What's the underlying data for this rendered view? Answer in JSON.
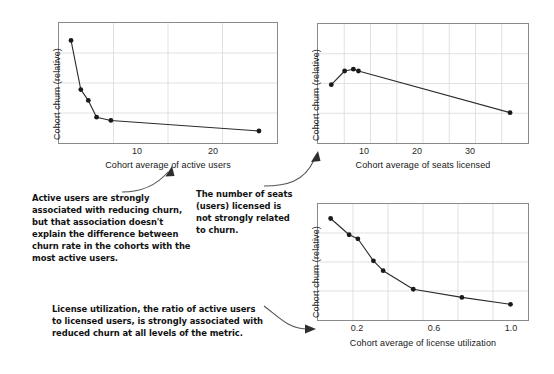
{
  "figure": {
    "background": "#ffffff",
    "line_color": "#2b2b2b",
    "marker_color": "#1a1a1a",
    "grid_color": "#d9d9d9",
    "axis_color": "#8a8a8a",
    "annotation_color": "#121212",
    "arrow_color": "#555555"
  },
  "chart_data": [
    {
      "id": "active-users",
      "type": "line",
      "title": "",
      "xlabel": "Cohort average of active users",
      "ylabel": "Cohort churn (relative)",
      "xlim": [
        0,
        29
      ],
      "ylim": [
        0,
        10
      ],
      "xticks": [
        10,
        20
      ],
      "xticklabels": [
        "10",
        "20"
      ],
      "yticks": [],
      "yticklabels": [],
      "grid": true,
      "markers": true,
      "x": [
        1.6,
        2.9,
        3.9,
        5.0,
        6.9,
        26.6
      ],
      "y": [
        8.55,
        4.45,
        3.55,
        2.15,
        1.88,
        1.0
      ]
    },
    {
      "id": "seats-licensed",
      "type": "line",
      "title": "",
      "xlabel": "Cohort average of seats licensed",
      "ylabel": "Cohort churn (relative)",
      "xlim": [
        0,
        41
      ],
      "ylim": [
        0,
        10
      ],
      "xticks": [
        10,
        20,
        30
      ],
      "xticklabels": [
        "10",
        "20",
        "30"
      ],
      "yticks": [],
      "yticklabels": [],
      "grid": true,
      "markers": true,
      "x": [
        2.6,
        5.2,
        6.9,
        7.9,
        37.5
      ],
      "y": [
        4.9,
        6.05,
        6.2,
        6.05,
        2.55
      ]
    },
    {
      "id": "license-utilization",
      "type": "line",
      "title": "",
      "xlabel": "Cohort average of license utilization",
      "ylabel": "Cohort churn (relative)",
      "xlim": [
        0.04,
        1.12
      ],
      "ylim": [
        0,
        10
      ],
      "xticks": [
        0.2,
        0.6,
        1.0
      ],
      "xticklabels": [
        "0.2",
        "0.6",
        "1.0"
      ],
      "yticks": [],
      "yticklabels": [],
      "grid": true,
      "markers": true,
      "x": [
        0.105,
        0.2,
        0.245,
        0.325,
        0.375,
        0.53,
        0.78,
        1.03
      ],
      "y": [
        8.75,
        7.35,
        7.0,
        5.1,
        4.25,
        2.65,
        1.95,
        1.35
      ]
    }
  ],
  "annotations": [
    {
      "id": "note-active-users",
      "text": "Active users are strongly associated with reducing churn, but that association doesn't explain the difference between churn rate in the cohorts with the most active users."
    },
    {
      "id": "note-seats-licensed",
      "text": "The number of seats (users) licensed is not strongly related to churn."
    },
    {
      "id": "note-license-utilization",
      "text": "License utilization, the ratio of active users to licensed users, is strongly associated with reduced churn at all levels of the metric."
    }
  ]
}
